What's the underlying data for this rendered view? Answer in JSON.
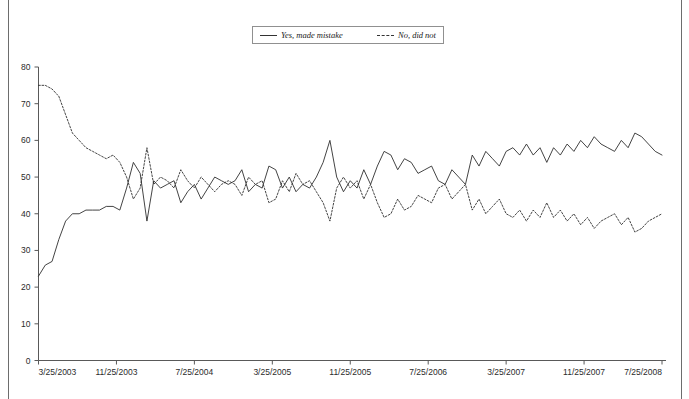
{
  "legend": {
    "position": "top-center",
    "entries": [
      {
        "label": "Yes, made mistake",
        "style": "solid",
        "icon": "solid-line-icon"
      },
      {
        "label": "No, did not",
        "style": "dashed",
        "icon": "dashed-line-icon"
      }
    ]
  },
  "caption": {
    "text": ""
  },
  "chart_data": {
    "type": "line",
    "title": "",
    "subtitle": "",
    "xlabel": "",
    "ylabel": "",
    "grid": false,
    "legend_position": "top-center",
    "ylim": [
      0,
      80
    ],
    "yticks": [
      0,
      10,
      20,
      30,
      40,
      50,
      60,
      70,
      80
    ],
    "xticks": [
      "3/25/2003",
      "11/25/2003",
      "7/25/2004",
      "3/25/2005",
      "11/25/2005",
      "7/25/2006",
      "3/25/2007",
      "11/25/2007",
      "7/25/2008"
    ],
    "xlim": [
      "3/25/2003",
      "7/25/2008"
    ],
    "x_index_range": [
      0,
      130
    ],
    "series": [
      {
        "name": "Yes, made mistake",
        "style": "solid",
        "color": "#2f2f2f",
        "values": [
          23,
          26,
          27,
          33,
          38,
          40,
          40,
          41,
          41,
          41,
          42,
          42,
          41,
          47,
          54,
          51,
          38,
          49,
          47,
          48,
          49,
          43,
          46,
          48,
          44,
          47,
          50,
          49,
          48,
          49,
          52,
          46,
          48,
          47,
          53,
          52,
          47,
          50,
          46,
          48,
          47,
          50,
          54,
          60,
          50,
          46,
          49,
          47,
          52,
          48,
          53,
          57,
          56,
          52,
          55,
          54,
          51,
          52,
          53,
          49,
          48,
          52,
          50,
          48,
          56,
          53,
          57,
          55,
          53,
          57,
          58,
          56,
          59,
          56,
          58,
          54,
          58,
          56,
          59,
          57,
          60,
          58,
          61,
          59,
          58,
          57,
          60,
          58,
          62,
          61,
          59,
          57,
          56
        ]
      },
      {
        "name": "No, did not",
        "style": "dashed",
        "color": "#2f2f2f",
        "values": [
          75,
          75,
          74,
          72,
          67,
          62,
          60,
          58,
          57,
          56,
          55,
          56,
          54,
          50,
          44,
          47,
          58,
          48,
          50,
          49,
          47,
          52,
          49,
          47,
          50,
          48,
          46,
          48,
          49,
          48,
          45,
          50,
          48,
          49,
          43,
          44,
          49,
          46,
          51,
          48,
          49,
          46,
          43,
          38,
          47,
          50,
          47,
          49,
          44,
          48,
          43,
          39,
          40,
          44,
          41,
          42,
          45,
          44,
          43,
          47,
          48,
          44,
          46,
          48,
          41,
          44,
          40,
          42,
          44,
          40,
          39,
          41,
          38,
          41,
          39,
          43,
          39,
          41,
          38,
          40,
          37,
          39,
          36,
          38,
          39,
          40,
          37,
          39,
          35,
          36,
          38,
          39,
          40
        ]
      }
    ]
  }
}
